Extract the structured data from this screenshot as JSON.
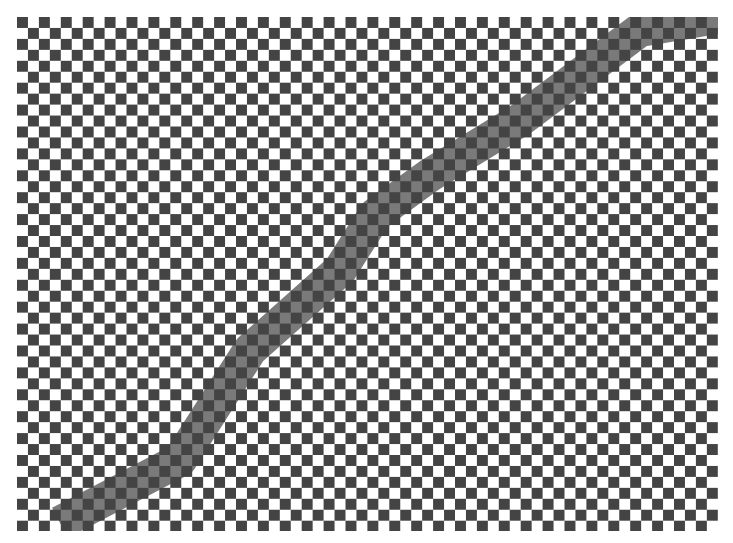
{
  "image": {
    "description": "Checkerboard pattern with a diagonal mid-gray band",
    "background_color": "#ffffff",
    "board": {
      "left": 17,
      "top": 17,
      "width": 701,
      "height": 514,
      "cell_size": 10.95,
      "columns": 64,
      "rows": 47,
      "dark_color": "#444444",
      "light_color": "#ffffff"
    },
    "band": {
      "color": "#7a7a7a",
      "width": 34,
      "path": [
        [
          58,
          498
        ],
        [
          163,
          443
        ],
        [
          233,
          333
        ],
        [
          323,
          253
        ],
        [
          358,
          198
        ],
        [
          413,
          158
        ],
        [
          503,
          103
        ],
        [
          623,
          13
        ],
        [
          700,
          0
        ]
      ]
    }
  }
}
